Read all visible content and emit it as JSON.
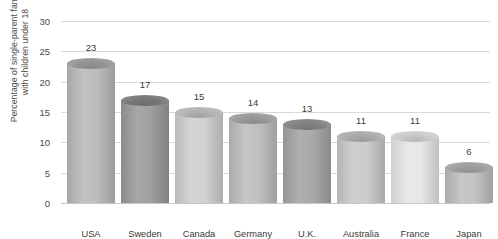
{
  "chart_data": {
    "type": "bar",
    "title": "",
    "subtitle": "",
    "xlabel": "",
    "ylabel": "Percentage of single-parent families with children under 18",
    "ylabel_lines": [
      "Percentage of single-parent families",
      "with children under 18"
    ],
    "categories": [
      "USA",
      "Sweden",
      "Canada",
      "Germany",
      "U.K.",
      "Australia",
      "France",
      "Japan"
    ],
    "values": [
      23,
      17,
      15,
      14,
      13,
      11,
      11,
      6
    ],
    "value_labels": [
      "23",
      "17",
      "15",
      "14",
      "13",
      "11",
      "11",
      "6"
    ],
    "ylim": [
      0,
      30
    ],
    "ytick_values": [
      0,
      5,
      10,
      15,
      20,
      25,
      30
    ],
    "ytick_labels": [
      "0",
      "5",
      "10",
      "15",
      "20",
      "25",
      "30"
    ],
    "grid": true,
    "grid_axis": "y",
    "legend": "none",
    "bar_style": "3d-cylinder",
    "bar_colors": [
      "#b9b9b9",
      "#9a9a9a",
      "#cfcfcf",
      "#bdbdbd",
      "#a4a4a4",
      "#c9c9c9",
      "#e6e6e6",
      "#bfbfbf"
    ],
    "bar_cap_colors": [
      "#9d9d9d",
      "#7e7e7e",
      "#bcbcbc",
      "#a2a2a2",
      "#8a8a8a",
      "#b4b4b4",
      "#d6d6d6",
      "#a8a8a8"
    ],
    "grid_color": "#d9d9d9",
    "axis_color": "#c8c8c8",
    "text_color": "#3a3a3a",
    "background": "#ffffff"
  }
}
